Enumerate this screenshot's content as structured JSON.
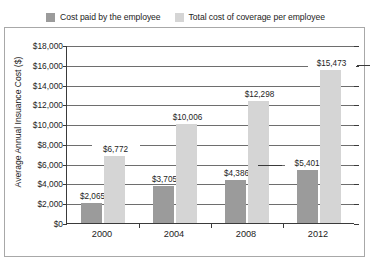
{
  "chart_data": {
    "type": "bar",
    "title": "",
    "xlabel": "",
    "ylabel": "Average Annual Insuance Cost ($)",
    "categories": [
      "2000",
      "2004",
      "2008",
      "2012"
    ],
    "series": [
      {
        "name": "Cost paid by the employee",
        "color": "#9b9b9b",
        "values": [
          2065,
          3705,
          4386,
          5401
        ],
        "labels": [
          "$2,065",
          "$3,705",
          "$4,386",
          "$5,401-"
        ]
      },
      {
        "name": "Total cost of coverage per employee",
        "color": "#d5d5d5",
        "values": [
          6772,
          10006,
          12298,
          15473
        ],
        "labels": [
          "$6,772",
          "$10,006",
          "$12,298",
          "$15,473"
        ]
      }
    ],
    "ylim": [
      0,
      18000
    ],
    "ytick_values": [
      0,
      2000,
      4000,
      6000,
      8000,
      10000,
      12000,
      14000,
      16000,
      18000
    ],
    "ytick_labels": [
      "$0",
      "$2,000",
      "$4,000",
      "$6,000",
      "$8,000",
      "$10,000",
      "$12,000",
      "$14,000",
      "$16,000",
      "$18,000"
    ],
    "grid": true,
    "legend_position": "top"
  },
  "legend": {
    "items": [
      {
        "label": "Cost paid by the employee",
        "color": "#9b9b9b"
      },
      {
        "label": "Total cost of coverage per employee",
        "color": "#d5d5d5"
      }
    ]
  }
}
